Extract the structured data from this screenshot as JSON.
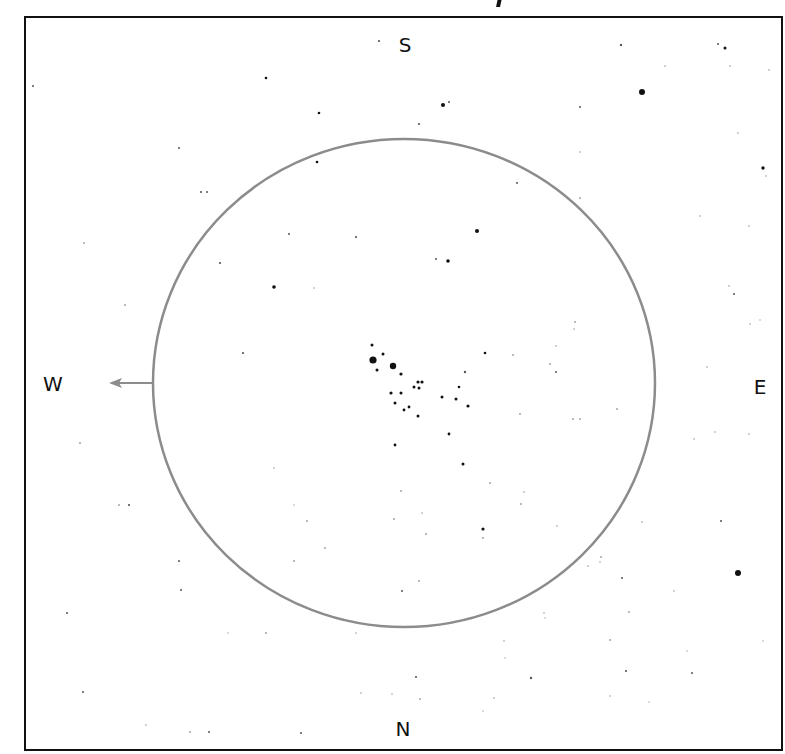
{
  "frame": {
    "x": 25,
    "y": 17,
    "width": 757,
    "height": 733,
    "stroke": "#111111",
    "stroke_width": 2
  },
  "field_of_view": {
    "cx": 404,
    "cy": 383,
    "rx": 251,
    "ry": 244,
    "stroke": "#8c8c8c",
    "stroke_width": 2.5
  },
  "motion_arrow": {
    "x1": 153,
    "y1": 383,
    "x2": 109,
    "y2": 383,
    "color": "#8c8c8c"
  },
  "compass": {
    "north": "N",
    "south": "S",
    "east": "E",
    "west": "W"
  },
  "compass_positions": {
    "south": {
      "x": 405,
      "y": 45
    },
    "north": {
      "x": 403,
      "y": 729
    },
    "west": {
      "x": 53,
      "y": 384
    },
    "east": {
      "x": 760,
      "y": 387
    }
  },
  "stars": [
    {
      "x": 373,
      "y": 360,
      "r": 3.6
    },
    {
      "x": 393,
      "y": 366,
      "r": 3.2
    },
    {
      "x": 642,
      "y": 92,
      "r": 3.0
    },
    {
      "x": 738,
      "y": 573,
      "r": 3.0
    },
    {
      "x": 443,
      "y": 105,
      "r": 2.0
    },
    {
      "x": 477,
      "y": 231,
      "r": 2.0
    },
    {
      "x": 448,
      "y": 261,
      "r": 1.8
    },
    {
      "x": 274,
      "y": 287,
      "r": 1.8
    },
    {
      "x": 763,
      "y": 168,
      "r": 1.7
    },
    {
      "x": 725,
      "y": 48,
      "r": 1.5
    },
    {
      "x": 372,
      "y": 345,
      "r": 1.5
    },
    {
      "x": 383,
      "y": 354,
      "r": 1.5
    },
    {
      "x": 377,
      "y": 370,
      "r": 1.5
    },
    {
      "x": 401,
      "y": 374,
      "r": 1.6
    },
    {
      "x": 418,
      "y": 382,
      "r": 1.6
    },
    {
      "x": 422,
      "y": 382,
      "r": 1.6
    },
    {
      "x": 414,
      "y": 387,
      "r": 1.5
    },
    {
      "x": 419,
      "y": 388,
      "r": 1.5
    },
    {
      "x": 391,
      "y": 393,
      "r": 1.6
    },
    {
      "x": 401,
      "y": 393,
      "r": 1.5
    },
    {
      "x": 395,
      "y": 403,
      "r": 1.5
    },
    {
      "x": 404,
      "y": 410,
      "r": 1.4
    },
    {
      "x": 409,
      "y": 407,
      "r": 1.4
    },
    {
      "x": 418,
      "y": 416,
      "r": 1.5
    },
    {
      "x": 442,
      "y": 397,
      "r": 1.5
    },
    {
      "x": 456,
      "y": 399,
      "r": 1.5
    },
    {
      "x": 468,
      "y": 406,
      "r": 1.6
    },
    {
      "x": 459,
      "y": 387,
      "r": 1.3
    },
    {
      "x": 485,
      "y": 353,
      "r": 1.3
    },
    {
      "x": 465,
      "y": 372,
      "r": 1.2
    },
    {
      "x": 449,
      "y": 434,
      "r": 1.4
    },
    {
      "x": 395,
      "y": 445,
      "r": 1.4
    },
    {
      "x": 463,
      "y": 464,
      "r": 1.5
    },
    {
      "x": 483,
      "y": 529,
      "r": 1.6
    },
    {
      "x": 266,
      "y": 78,
      "r": 1.3
    },
    {
      "x": 319,
      "y": 113,
      "r": 1.3
    },
    {
      "x": 317,
      "y": 162,
      "r": 1.3
    },
    {
      "x": 379,
      "y": 41,
      "r": 1.1
    },
    {
      "x": 621,
      "y": 45,
      "r": 1.2
    },
    {
      "x": 718,
      "y": 44,
      "r": 1.0
    },
    {
      "x": 449,
      "y": 102,
      "r": 1.0
    },
    {
      "x": 419,
      "y": 124,
      "r": 1.1
    },
    {
      "x": 580,
      "y": 107,
      "r": 1.0
    },
    {
      "x": 517,
      "y": 183,
      "r": 1.0
    },
    {
      "x": 580,
      "y": 152,
      "r": 0.8
    },
    {
      "x": 665,
      "y": 66,
      "r": 0.8
    },
    {
      "x": 730,
      "y": 66,
      "r": 0.8
    },
    {
      "x": 769,
      "y": 70,
      "r": 0.8
    },
    {
      "x": 738,
      "y": 133,
      "r": 0.8
    },
    {
      "x": 766,
      "y": 176,
      "r": 0.8
    },
    {
      "x": 580,
      "y": 198,
      "r": 0.9
    },
    {
      "x": 700,
      "y": 216,
      "r": 0.8
    },
    {
      "x": 749,
      "y": 226,
      "r": 0.8
    },
    {
      "x": 734,
      "y": 294,
      "r": 1.0
    },
    {
      "x": 729,
      "y": 286,
      "r": 0.8
    },
    {
      "x": 750,
      "y": 324,
      "r": 0.8
    },
    {
      "x": 707,
      "y": 367,
      "r": 0.8
    },
    {
      "x": 760,
      "y": 320,
      "r": 0.7
    },
    {
      "x": 33,
      "y": 86,
      "r": 1.0
    },
    {
      "x": 179,
      "y": 148,
      "r": 1.0
    },
    {
      "x": 201,
      "y": 192,
      "r": 1.1
    },
    {
      "x": 207,
      "y": 192,
      "r": 1.0
    },
    {
      "x": 84,
      "y": 243,
      "r": 0.9
    },
    {
      "x": 125,
      "y": 305,
      "r": 0.9
    },
    {
      "x": 220,
      "y": 263,
      "r": 1.1
    },
    {
      "x": 243,
      "y": 353,
      "r": 1.1
    },
    {
      "x": 289,
      "y": 234,
      "r": 1.0
    },
    {
      "x": 356,
      "y": 237,
      "r": 1.1
    },
    {
      "x": 436,
      "y": 259,
      "r": 1.0
    },
    {
      "x": 314,
      "y": 288,
      "r": 0.8
    },
    {
      "x": 575,
      "y": 322,
      "r": 0.9
    },
    {
      "x": 574,
      "y": 329,
      "r": 0.8
    },
    {
      "x": 556,
      "y": 372,
      "r": 1.0
    },
    {
      "x": 573,
      "y": 419,
      "r": 0.9
    },
    {
      "x": 580,
      "y": 419,
      "r": 0.9
    },
    {
      "x": 617,
      "y": 409,
      "r": 0.9
    },
    {
      "x": 556,
      "y": 346,
      "r": 0.8
    },
    {
      "x": 520,
      "y": 414,
      "r": 0.9
    },
    {
      "x": 513,
      "y": 355,
      "r": 0.9
    },
    {
      "x": 550,
      "y": 364,
      "r": 0.9
    },
    {
      "x": 80,
      "y": 443,
      "r": 0.9
    },
    {
      "x": 119,
      "y": 505,
      "r": 0.9
    },
    {
      "x": 129,
      "y": 505,
      "r": 1.1
    },
    {
      "x": 179,
      "y": 561,
      "r": 1.0
    },
    {
      "x": 274,
      "y": 468,
      "r": 0.8
    },
    {
      "x": 294,
      "y": 561,
      "r": 0.9
    },
    {
      "x": 294,
      "y": 505,
      "r": 0.7
    },
    {
      "x": 307,
      "y": 521,
      "r": 0.9
    },
    {
      "x": 325,
      "y": 548,
      "r": 0.9
    },
    {
      "x": 394,
      "y": 519,
      "r": 0.9
    },
    {
      "x": 401,
      "y": 491,
      "r": 0.9
    },
    {
      "x": 422,
      "y": 513,
      "r": 0.8
    },
    {
      "x": 426,
      "y": 534,
      "r": 0.9
    },
    {
      "x": 402,
      "y": 591,
      "r": 1.0
    },
    {
      "x": 419,
      "y": 581,
      "r": 0.9
    },
    {
      "x": 524,
      "y": 492,
      "r": 0.8
    },
    {
      "x": 521,
      "y": 504,
      "r": 0.9
    },
    {
      "x": 490,
      "y": 483,
      "r": 0.9
    },
    {
      "x": 483,
      "y": 538,
      "r": 0.9
    },
    {
      "x": 557,
      "y": 526,
      "r": 0.8
    },
    {
      "x": 601,
      "y": 557,
      "r": 0.9
    },
    {
      "x": 622,
      "y": 578,
      "r": 1.0
    },
    {
      "x": 642,
      "y": 522,
      "r": 0.8
    },
    {
      "x": 694,
      "y": 439,
      "r": 0.8
    },
    {
      "x": 715,
      "y": 432,
      "r": 0.8
    },
    {
      "x": 721,
      "y": 521,
      "r": 1.0
    },
    {
      "x": 674,
      "y": 591,
      "r": 0.8
    },
    {
      "x": 749,
      "y": 434,
      "r": 0.8
    },
    {
      "x": 600,
      "y": 562,
      "r": 0.8
    },
    {
      "x": 588,
      "y": 566,
      "r": 0.8
    },
    {
      "x": 67,
      "y": 613,
      "r": 1.0
    },
    {
      "x": 181,
      "y": 590,
      "r": 1.0
    },
    {
      "x": 228,
      "y": 633,
      "r": 0.7
    },
    {
      "x": 266,
      "y": 633,
      "r": 0.9
    },
    {
      "x": 83,
      "y": 692,
      "r": 1.0
    },
    {
      "x": 146,
      "y": 725,
      "r": 0.8
    },
    {
      "x": 190,
      "y": 732,
      "r": 0.9
    },
    {
      "x": 209,
      "y": 732,
      "r": 1.0
    },
    {
      "x": 301,
      "y": 733,
      "r": 1.0
    },
    {
      "x": 416,
      "y": 677,
      "r": 1.1
    },
    {
      "x": 531,
      "y": 678,
      "r": 1.2
    },
    {
      "x": 610,
      "y": 640,
      "r": 0.9
    },
    {
      "x": 629,
      "y": 612,
      "r": 0.9
    },
    {
      "x": 626,
      "y": 671,
      "r": 1.1
    },
    {
      "x": 692,
      "y": 673,
      "r": 1.0
    },
    {
      "x": 504,
      "y": 641,
      "r": 0.8
    },
    {
      "x": 505,
      "y": 658,
      "r": 0.7
    },
    {
      "x": 494,
      "y": 698,
      "r": 0.8
    },
    {
      "x": 483,
      "y": 711,
      "r": 0.7
    },
    {
      "x": 610,
      "y": 696,
      "r": 0.8
    },
    {
      "x": 649,
      "y": 702,
      "r": 0.7
    },
    {
      "x": 687,
      "y": 651,
      "r": 0.7
    },
    {
      "x": 763,
      "y": 641,
      "r": 0.7
    },
    {
      "x": 544,
      "y": 613,
      "r": 0.8
    },
    {
      "x": 545,
      "y": 618,
      "r": 0.7
    },
    {
      "x": 356,
      "y": 633,
      "r": 0.8
    },
    {
      "x": 361,
      "y": 693,
      "r": 0.8
    },
    {
      "x": 392,
      "y": 694,
      "r": 0.8
    },
    {
      "x": 420,
      "y": 699,
      "r": 0.9
    }
  ]
}
